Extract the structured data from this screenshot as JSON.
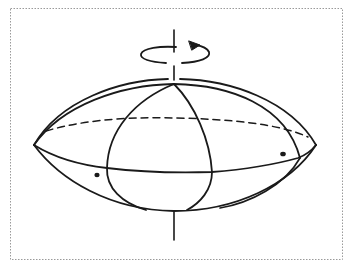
{
  "figure": {
    "colors": {
      "ink": "#1a1a1a",
      "border": "#9a9a9a",
      "background": "#ffffff"
    },
    "elements": {
      "border": "dotted-frame",
      "axis": "rotation-axis",
      "rotation_arrow": "counter-clockwise-arrow",
      "outline_top": "upper-surface",
      "outline_bottom": "lower-surface",
      "equator_front": "front-equator",
      "equator_back": "back-equator-dashed",
      "meridians": [
        "meridian-left",
        "meridian-right"
      ],
      "points": [
        "surface-point-left",
        "surface-point-right"
      ]
    }
  }
}
